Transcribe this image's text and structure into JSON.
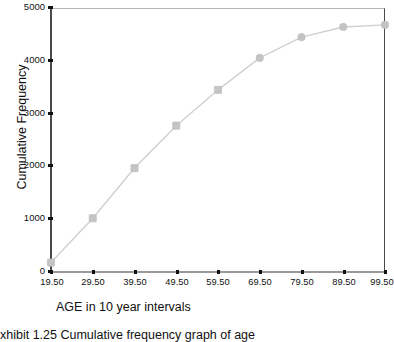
{
  "chart_data": {
    "type": "line",
    "title": "",
    "xlabel": "AGE in 10 year intervals",
    "ylabel": "Cumulative Frequency",
    "x_tick_labels": [
      "19.50",
      "29.50",
      "39.50",
      "49.50",
      "59.50",
      "69.50",
      "79.50",
      "89.50",
      "99.50"
    ],
    "y_tick_labels": [
      "0",
      "1000",
      "2000",
      "3000",
      "4000",
      "5000"
    ],
    "y_tick_values": [
      0,
      1000,
      2000,
      3000,
      4000,
      5000
    ],
    "ylim": [
      0,
      5000
    ],
    "grid": false,
    "legend": "none",
    "marker": "square",
    "series": [
      {
        "name": "Cumulative Frequency",
        "categories": [
          "19.50",
          "29.50",
          "39.50",
          "49.50",
          "59.50",
          "69.50",
          "79.50",
          "89.50",
          "99.50"
        ],
        "values": [
          170,
          1010,
          1963,
          2767,
          3447,
          4053,
          4447,
          4640,
          4680
        ]
      }
    ]
  },
  "axes": {
    "x_title": "AGE in 10 year intervals",
    "y_title": "Cumulative Frequency"
  },
  "caption": {
    "text": "xhibit 1.25    Cumulative frequency graph of age"
  },
  "colors": {
    "line": "#d0d0d0",
    "marker": "#c4c4c4",
    "marker_edge": "#b8b8b8",
    "axis": "#4a4a4a",
    "text": "#111111"
  }
}
